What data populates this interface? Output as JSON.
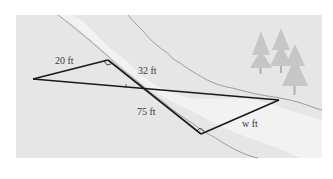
{
  "figure": {
    "labels": {
      "side_a": "20 ft",
      "side_b": "32 ft",
      "side_c": "75 ft",
      "side_w": "w ft"
    },
    "colors": {
      "background": "#e6e6e6",
      "far_bank": "#e2e2e2",
      "river": "#f1f1f1",
      "near_bank": "#e4e4e4",
      "shore_line": "#8a8a8a",
      "triangle_line": "#1a1a1a",
      "trees": "#c4c4c4",
      "label_text": "#3a3a3a"
    }
  }
}
